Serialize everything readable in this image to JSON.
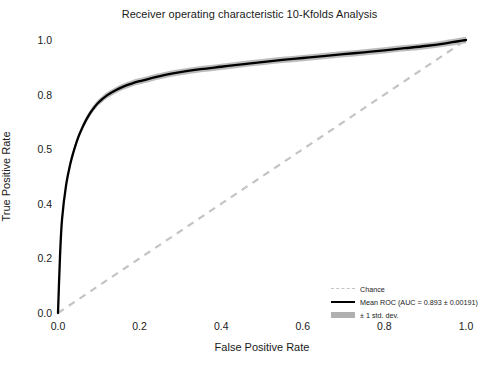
{
  "chart_data": {
    "type": "line",
    "title": "Receiver operating characteristic 10-Kfolds Analysis",
    "xlabel": "False Positive Rate",
    "ylabel": "True Positive Rate",
    "xlim": [
      0.0,
      1.0
    ],
    "ylim": [
      0.0,
      1.0
    ],
    "xticks": [
      "0.0",
      "0.2",
      "0.4",
      "0.6",
      "0.8",
      "1.0"
    ],
    "xtick_values": [
      0.0,
      0.2,
      0.4,
      0.6,
      0.8,
      1.0
    ],
    "yticks": [
      "0.0",
      "0.2",
      "0.4",
      "0.5",
      "0.8",
      "1.0"
    ],
    "ytick_values": [
      0.0,
      0.2,
      0.4,
      0.6,
      0.8,
      1.0
    ],
    "grid": false,
    "legend_position": "lower right",
    "series": [
      {
        "name": "Chance",
        "style": "dashed",
        "color": "#c4c4c4",
        "x": [
          0.0,
          1.0
        ],
        "values": [
          0.0,
          1.0
        ]
      },
      {
        "name": "Mean ROC (AUC = 0.893 ± 0.00191)",
        "style": "solid",
        "color": "#000000",
        "auc": 0.893,
        "auc_std": 0.00191,
        "x": [
          0.0,
          0.005,
          0.01,
          0.02,
          0.03,
          0.04,
          0.05,
          0.06,
          0.07,
          0.08,
          0.09,
          0.1,
          0.12,
          0.14,
          0.16,
          0.18,
          0.2,
          0.25,
          0.3,
          0.35,
          0.4,
          0.45,
          0.5,
          0.55,
          0.6,
          0.65,
          0.7,
          0.75,
          0.8,
          0.85,
          0.9,
          0.95,
          1.0
        ],
        "values": [
          0.0,
          0.21,
          0.345,
          0.47,
          0.545,
          0.6,
          0.645,
          0.68,
          0.71,
          0.735,
          0.755,
          0.772,
          0.797,
          0.815,
          0.829,
          0.84,
          0.849,
          0.868,
          0.882,
          0.893,
          0.902,
          0.911,
          0.919,
          0.927,
          0.934,
          0.941,
          0.948,
          0.955,
          0.962,
          0.97,
          0.978,
          0.988,
          1.0
        ]
      },
      {
        "name": "± 1 std. dev.",
        "style": "band",
        "color": "#b0b0b0",
        "std": 0.00191
      }
    ]
  },
  "legend": {
    "items": [
      {
        "label": "Chance",
        "key": "dashed-line-key"
      },
      {
        "label": "Mean ROC (AUC = 0.893 ± 0.00191)",
        "key": "solid-line-key"
      },
      {
        "label": "± 1 std. dev.",
        "key": "band-swatch-key"
      }
    ]
  }
}
